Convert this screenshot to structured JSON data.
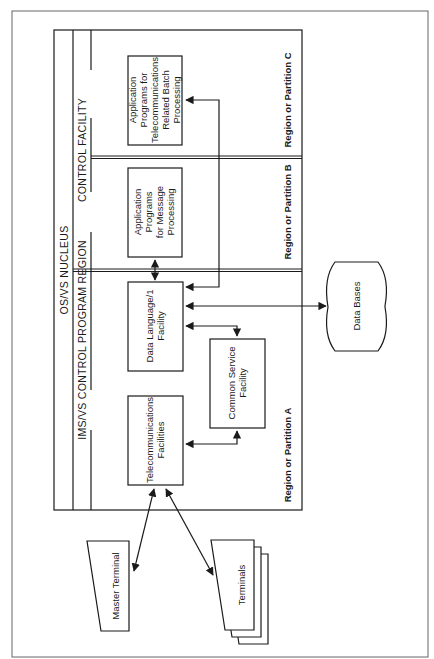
{
  "diagram": {
    "orientation": "rotated-90-ccw",
    "headers": {
      "os_vs_nucleus": "OS/VS NUCLEUS",
      "ims_control_region": "IMS/VS CONTROL PROGRAM REGION",
      "control_facility": "CONTROL FACILITY"
    },
    "partitions": {
      "a": "Region or Partition A",
      "b": "Region or Partition B",
      "c": "Region or Partition C"
    },
    "boxes": {
      "telecom": [
        "Telecommunications",
        "Facilities"
      ],
      "dl1": [
        "Data Language/1",
        "Facility"
      ],
      "common_service": [
        "Common Service",
        "Facility"
      ],
      "app_message": [
        "Application",
        "Programs",
        "for Message",
        "Processing"
      ],
      "app_batch": [
        "Application",
        "Programs for",
        "Telecommunications",
        "Related Batch",
        "Processing"
      ],
      "data_bases": "Data Bases",
      "master_terminal": "Master Terminal",
      "terminals": "Terminals"
    },
    "connections": [
      {
        "from": "telecom",
        "to": "master_terminal",
        "type": "bidirectional"
      },
      {
        "from": "telecom",
        "to": "terminals",
        "type": "bidirectional"
      },
      {
        "from": "telecom",
        "to": "common_service",
        "type": "bidirectional"
      },
      {
        "from": "dl1",
        "to": "common_service",
        "type": "bidirectional"
      },
      {
        "from": "dl1",
        "to": "data_bases",
        "type": "bidirectional"
      },
      {
        "from": "dl1",
        "to": "app_message",
        "type": "bidirectional"
      },
      {
        "from": "dl1",
        "to": "app_batch",
        "type": "bidirectional"
      }
    ],
    "colors": {
      "ink": "#1a1a1a",
      "paper": "#ffffff",
      "frame": "#555555"
    }
  }
}
